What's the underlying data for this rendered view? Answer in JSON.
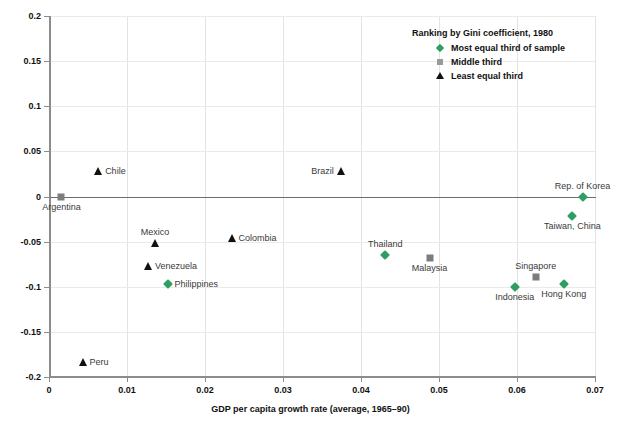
{
  "chart_data": {
    "type": "scatter",
    "title": "",
    "xlabel": "GDP per capita growth rate (average, 1965–90)",
    "ylabel": "",
    "xlim": [
      0,
      0.07
    ],
    "ylim": [
      -0.2,
      0.2
    ],
    "xticks": [
      "0",
      "0.01",
      "0.02",
      "0.03",
      "0.04",
      "0.05",
      "0.06",
      "0.07"
    ],
    "xtick_values": [
      0,
      0.01,
      0.02,
      0.03,
      0.04,
      0.05,
      0.06,
      0.07
    ],
    "yticks": [
      "0.2",
      "0.15",
      "0.1",
      "0.05",
      "0",
      "-0.05",
      "-0.1",
      "-0.15",
      "-0.2"
    ],
    "ytick_values": [
      0.2,
      0.15,
      0.1,
      0.05,
      0,
      -0.05,
      -0.1,
      -0.15,
      -0.2
    ],
    "grid": true,
    "zero_line": true,
    "legend_position": "top-right",
    "legend": {
      "title": "Ranking by Gini coefficient, 1980",
      "entries": [
        {
          "label": "Most equal third of sample",
          "marker": "diamond",
          "color": "#2e9e63"
        },
        {
          "label": "Middle third",
          "marker": "square",
          "color": "#9a9a9a"
        },
        {
          "label": "Least equal third",
          "marker": "triangle",
          "color": "#111111"
        }
      ]
    },
    "series": [
      {
        "name": "Most equal third of sample",
        "marker": "diamond",
        "color": "#2e9e63",
        "points": [
          {
            "label": "Philippines",
            "x": 0.0152,
            "y": -0.0965,
            "label_pos": "right"
          },
          {
            "label": "Thailand",
            "x": 0.0431,
            "y": -0.065,
            "label_pos": "above"
          },
          {
            "label": "Indonesia",
            "x": 0.0597,
            "y": -0.1,
            "label_pos": "below"
          },
          {
            "label": "Hong Kong",
            "x": 0.066,
            "y": -0.0965,
            "label_pos": "below"
          },
          {
            "label": "Taiwan, China",
            "x": 0.0671,
            "y": -0.0215,
            "label_pos": "below"
          },
          {
            "label": "Rep. of Korea",
            "x": 0.0684,
            "y": -0.0005,
            "label_pos": "above"
          }
        ]
      },
      {
        "name": "Middle third",
        "marker": "square",
        "color": "#7d7d7d",
        "points": [
          {
            "label": "Argentina",
            "x": 0.0016,
            "y": -0.001,
            "label_pos": "below"
          },
          {
            "label": "Malaysia",
            "x": 0.0488,
            "y": -0.068,
            "label_pos": "below"
          },
          {
            "label": "Singapore",
            "x": 0.0624,
            "y": -0.089,
            "label_pos": "above"
          }
        ]
      },
      {
        "name": "Least equal third",
        "marker": "triangle",
        "color": "#111111",
        "points": [
          {
            "label": "Chile",
            "x": 0.0063,
            "y": 0.028,
            "label_pos": "right"
          },
          {
            "label": "Brazil",
            "x": 0.0374,
            "y": 0.028,
            "label_pos": "left"
          },
          {
            "label": "Mexico",
            "x": 0.0136,
            "y": -0.052,
            "label_pos": "above"
          },
          {
            "label": "Colombia",
            "x": 0.0234,
            "y": -0.0455,
            "label_pos": "right"
          },
          {
            "label": "Venezuela",
            "x": 0.0127,
            "y": -0.077,
            "label_pos": "right"
          },
          {
            "label": "Peru",
            "x": 0.0043,
            "y": -0.183,
            "label_pos": "right"
          }
        ]
      }
    ]
  }
}
